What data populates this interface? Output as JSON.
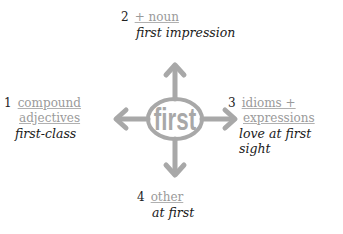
{
  "center": {
    "word": "first",
    "color": "#a8a8a8"
  },
  "branches": [
    {
      "number": "1",
      "label_lines": [
        "compound",
        "adjectives"
      ],
      "example": "first-class"
    },
    {
      "number": "2",
      "label_lines": [
        "+ noun"
      ],
      "example": "first impression"
    },
    {
      "number": "3",
      "label_lines": [
        "idioms +",
        "expressions"
      ],
      "example": "love at first sight"
    },
    {
      "number": "4",
      "label_lines": [
        "other"
      ],
      "example": "at first"
    }
  ],
  "colors": {
    "arrow": "#a8a8a8",
    "link": "#9a9a9a",
    "text": "#222222"
  }
}
